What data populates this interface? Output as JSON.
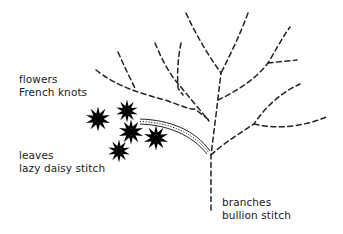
{
  "diagram": {
    "labels": {
      "flowers": {
        "line1": "flowers",
        "line2": "French knots"
      },
      "leaves": {
        "line1": "leaves",
        "line2": "lazy daisy stitch"
      },
      "branches": {
        "line1": "branches",
        "line2": "bullion stitch"
      }
    },
    "colors": {
      "ink": "#222222",
      "background": "#ffffff"
    }
  }
}
